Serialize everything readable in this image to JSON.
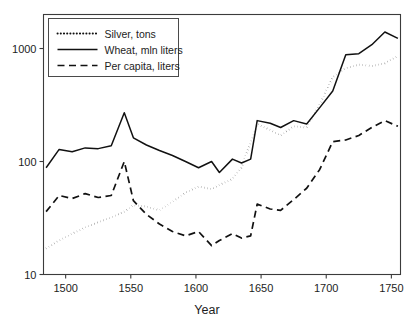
{
  "chart_data": {
    "type": "line",
    "title": "",
    "xlabel": "Year",
    "ylabel": "",
    "yscale": "log",
    "xlim": [
      1483,
      1757
    ],
    "ylim": [
      10,
      2000
    ],
    "grid": false,
    "legend_position": "top-left",
    "xticks": [
      1500,
      1550,
      1600,
      1650,
      1700,
      1750
    ],
    "xtick_labels": [
      "1500",
      "1550",
      "1600",
      "1650",
      "1700",
      "1750"
    ],
    "yticks": [
      10,
      100,
      1000
    ],
    "ytick_labels": [
      "10",
      "100",
      "1000"
    ],
    "x": [
      1485,
      1495,
      1505,
      1515,
      1525,
      1535,
      1545,
      1552,
      1562,
      1572,
      1582,
      1592,
      1602,
      1612,
      1618,
      1628,
      1635,
      1642,
      1647,
      1657,
      1665,
      1675,
      1685,
      1695,
      1705,
      1715,
      1725,
      1735,
      1745,
      1755
    ],
    "series": [
      {
        "name": "Silver, tons",
        "style": "dotted",
        "values": [
          17,
          20,
          23,
          26,
          29,
          32,
          36,
          41,
          40,
          37,
          44,
          53,
          60,
          57,
          62,
          70,
          88,
          150,
          215,
          190,
          170,
          205,
          200,
          320,
          560,
          670,
          720,
          700,
          740,
          860
        ]
      },
      {
        "name": "Wheat, mln liters",
        "style": "solid",
        "values": [
          88,
          128,
          122,
          132,
          130,
          138,
          270,
          162,
          140,
          125,
          113,
          100,
          88,
          100,
          80,
          105,
          97,
          105,
          230,
          218,
          200,
          230,
          215,
          300,
          420,
          880,
          900,
          1080,
          1400,
          1230
        ]
      },
      {
        "name": "Per capita, liters",
        "style": "dashed",
        "values": [
          36,
          50,
          47,
          52,
          48,
          50,
          100,
          45,
          34,
          28,
          24,
          22,
          24,
          18,
          20,
          23,
          21,
          22,
          42,
          38,
          37,
          46,
          58,
          85,
          150,
          155,
          170,
          200,
          230,
          205
        ]
      }
    ]
  },
  "axes": {
    "x_title": "Year",
    "y_title": ""
  },
  "legend": {
    "entries": [
      {
        "label": "Silver, tons",
        "style": "dotted"
      },
      {
        "label": "Wheat, mln liters",
        "style": "solid"
      },
      {
        "label": "Per capita, liters",
        "style": "dashed"
      }
    ]
  }
}
